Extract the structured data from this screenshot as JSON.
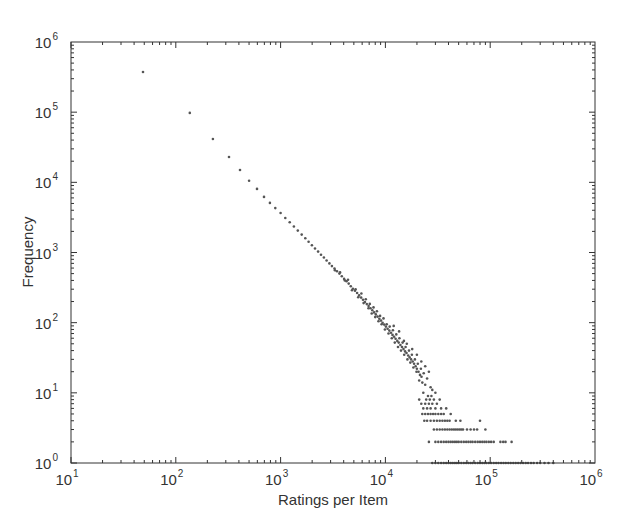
{
  "chart_data": {
    "type": "scatter",
    "title": "",
    "xlabel": "Ratings per Item",
    "ylabel": "Frequency",
    "xscale": "log",
    "yscale": "log",
    "xlim": [
      10,
      1000000
    ],
    "ylim": [
      1,
      1000000
    ],
    "grid": false,
    "legend": null,
    "x_ticks": [
      {
        "base": "10",
        "exp": "1",
        "value": 10
      },
      {
        "base": "10",
        "exp": "2",
        "value": 100
      },
      {
        "base": "10",
        "exp": "3",
        "value": 1000
      },
      {
        "base": "10",
        "exp": "4",
        "value": 10000
      },
      {
        "base": "10",
        "exp": "5",
        "value": 100000
      },
      {
        "base": "10",
        "exp": "6",
        "value": 1000000
      }
    ],
    "y_ticks": [
      {
        "base": "10",
        "exp": "0",
        "value": 1
      },
      {
        "base": "10",
        "exp": "1",
        "value": 10
      },
      {
        "base": "10",
        "exp": "2",
        "value": 100
      },
      {
        "base": "10",
        "exp": "3",
        "value": 1000
      },
      {
        "base": "10",
        "exp": "4",
        "value": 10000
      },
      {
        "base": "10",
        "exp": "5",
        "value": 100000
      },
      {
        "base": "10",
        "exp": "6",
        "value": 1000000
      }
    ],
    "marker_color": "#555555",
    "series": [
      {
        "name": "items",
        "trend": "power law, frequency ~ ratings^-1.5",
        "points": [
          [
            48.6,
            374000
          ],
          [
            136,
            97500
          ],
          [
            226,
            41500
          ],
          [
            322,
            23000
          ],
          [
            410,
            15000
          ],
          [
            500,
            10500
          ],
          [
            596,
            8050
          ],
          [
            695,
            6200
          ],
          [
            790,
            5100
          ],
          [
            890,
            4300
          ],
          [
            1000,
            3650
          ],
          [
            1110,
            3100
          ],
          [
            1220,
            2700
          ],
          [
            1340,
            2350
          ],
          [
            1460,
            2050
          ],
          [
            1590,
            1800
          ],
          [
            1720,
            1600
          ],
          [
            1850,
            1420
          ],
          [
            1990,
            1270
          ],
          [
            2130,
            1140
          ],
          [
            2280,
            1030
          ],
          [
            2430,
            930
          ],
          [
            2590,
            850
          ],
          [
            2750,
            770
          ],
          [
            2920,
            700
          ],
          [
            3090,
            640
          ],
          [
            3270,
            590
          ],
          [
            3450,
            540
          ],
          [
            3640,
            500
          ],
          [
            3840,
            460
          ],
          [
            4040,
            420
          ],
          [
            4250,
            390
          ],
          [
            4460,
            360
          ],
          [
            4680,
            330
          ],
          [
            4900,
            305
          ],
          [
            5130,
            285
          ],
          [
            5370,
            265
          ],
          [
            5610,
            245
          ],
          [
            5860,
            228
          ],
          [
            6110,
            212
          ],
          [
            6380,
            197
          ],
          [
            6650,
            184
          ],
          [
            6920,
            172
          ],
          [
            7210,
            160
          ],
          [
            7500,
            150
          ],
          [
            7800,
            140
          ],
          [
            8100,
            131
          ],
          [
            8420,
            122
          ],
          [
            8740,
            114
          ],
          [
            9070,
            107
          ],
          [
            9400,
            100
          ],
          [
            9750,
            94
          ],
          [
            10100,
            88
          ],
          [
            10500,
            82
          ],
          [
            10900,
            77
          ],
          [
            11300,
            72
          ],
          [
            11700,
            67
          ],
          [
            12100,
            63
          ],
          [
            12500,
            59
          ],
          [
            13000,
            55
          ],
          [
            13400,
            52
          ],
          [
            13900,
            48
          ],
          [
            14400,
            45
          ],
          [
            14900,
            42
          ],
          [
            15400,
            39
          ],
          [
            15900,
            37
          ],
          [
            16500,
            34
          ],
          [
            17000,
            32
          ],
          [
            17600,
            30
          ],
          [
            18200,
            28
          ],
          [
            18800,
            26
          ],
          [
            19400,
            24
          ],
          [
            20000,
            22
          ],
          [
            20700,
            20
          ],
          [
            21400,
            18
          ],
          [
            22100,
            17
          ],
          [
            3300,
            560
          ],
          [
            3700,
            520
          ],
          [
            4100,
            400
          ],
          [
            4400,
            410
          ],
          [
            4800,
            290
          ],
          [
            5200,
            300
          ],
          [
            5500,
            230
          ],
          [
            5900,
            260
          ],
          [
            6200,
            190
          ],
          [
            6500,
            215
          ],
          [
            6900,
            160
          ],
          [
            7100,
            185
          ],
          [
            7400,
            135
          ],
          [
            7700,
            165
          ],
          [
            8000,
            120
          ],
          [
            8300,
            145
          ],
          [
            8600,
            105
          ],
          [
            8900,
            125
          ],
          [
            9200,
            95
          ],
          [
            9600,
            115
          ],
          [
            9900,
            80
          ],
          [
            10300,
            95
          ],
          [
            10700,
            70
          ],
          [
            11000,
            88
          ],
          [
            11500,
            60
          ],
          [
            11800,
            78
          ],
          [
            12300,
            52
          ],
          [
            12700,
            68
          ],
          [
            13200,
            45
          ],
          [
            13600,
            60
          ],
          [
            14100,
            40
          ],
          [
            14600,
            52
          ],
          [
            15100,
            35
          ],
          [
            15600,
            45
          ],
          [
            16200,
            30
          ],
          [
            16800,
            40
          ],
          [
            17300,
            27
          ],
          [
            17900,
            35
          ],
          [
            18500,
            23
          ],
          [
            19100,
            30
          ],
          [
            19800,
            20
          ],
          [
            20400,
            26
          ],
          [
            21000,
            15
          ],
          [
            21800,
            22
          ],
          [
            22500,
            14
          ],
          [
            23200,
            19
          ],
          [
            24000,
            13
          ],
          [
            25000,
            16
          ],
          [
            12000,
            90
          ],
          [
            13500,
            75
          ],
          [
            15000,
            55
          ],
          [
            16000,
            50
          ],
          [
            18000,
            42
          ],
          [
            20000,
            35
          ],
          [
            22000,
            28
          ],
          [
            24000,
            24
          ],
          [
            26000,
            20
          ],
          [
            27000,
            12
          ],
          [
            28000,
            11
          ],
          [
            30000,
            10
          ],
          [
            23000,
            10
          ],
          [
            25500,
            9
          ],
          [
            27500,
            9
          ],
          [
            29000,
            8
          ],
          [
            21000,
            8
          ],
          [
            24500,
            8
          ],
          [
            26500,
            8
          ],
          [
            33000,
            8
          ],
          [
            22000,
            7
          ],
          [
            24000,
            7
          ],
          [
            26000,
            7
          ],
          [
            28000,
            7
          ],
          [
            31000,
            7
          ],
          [
            23000,
            6
          ],
          [
            25000,
            6
          ],
          [
            27000,
            6
          ],
          [
            30000,
            6
          ],
          [
            34000,
            6
          ],
          [
            38000,
            6
          ],
          [
            22500,
            5
          ],
          [
            24000,
            5
          ],
          [
            25500,
            5
          ],
          [
            27000,
            5
          ],
          [
            28500,
            5
          ],
          [
            30000,
            5
          ],
          [
            32000,
            5
          ],
          [
            34000,
            5
          ],
          [
            36000,
            5
          ],
          [
            42000,
            5
          ],
          [
            23500,
            4
          ],
          [
            25000,
            4
          ],
          [
            27000,
            4
          ],
          [
            29000,
            4
          ],
          [
            31000,
            4
          ],
          [
            33000,
            4
          ],
          [
            35000,
            4
          ],
          [
            37000,
            4
          ],
          [
            39000,
            4
          ],
          [
            41000,
            4
          ],
          [
            47000,
            4
          ],
          [
            52000,
            4
          ],
          [
            80000,
            4
          ],
          [
            29000,
            3
          ],
          [
            31000,
            3
          ],
          [
            33000,
            3
          ],
          [
            35000,
            3
          ],
          [
            37000,
            3
          ],
          [
            39000,
            3
          ],
          [
            41000,
            3
          ],
          [
            43000,
            3
          ],
          [
            45000,
            3
          ],
          [
            47000,
            3
          ],
          [
            49000,
            3
          ],
          [
            51000,
            3
          ],
          [
            53000,
            3
          ],
          [
            55000,
            3
          ],
          [
            60000,
            3
          ],
          [
            65000,
            3
          ],
          [
            70000,
            3
          ],
          [
            75000,
            3
          ],
          [
            90000,
            3
          ],
          [
            26000,
            2
          ],
          [
            30000,
            2
          ],
          [
            32000,
            2
          ],
          [
            34000,
            2
          ],
          [
            36000,
            2
          ],
          [
            38000,
            2
          ],
          [
            40000,
            2
          ],
          [
            42000,
            2
          ],
          [
            44000,
            2
          ],
          [
            46000,
            2
          ],
          [
            48000,
            2
          ],
          [
            50000,
            2
          ],
          [
            53000,
            2
          ],
          [
            56000,
            2
          ],
          [
            59000,
            2
          ],
          [
            62000,
            2
          ],
          [
            65000,
            2
          ],
          [
            68000,
            2
          ],
          [
            72000,
            2
          ],
          [
            76000,
            2
          ],
          [
            80000,
            2
          ],
          [
            84000,
            2
          ],
          [
            88000,
            2
          ],
          [
            92000,
            2
          ],
          [
            97000,
            2
          ],
          [
            102000,
            2
          ],
          [
            108000,
            2
          ],
          [
            125000,
            2
          ],
          [
            133000,
            2
          ],
          [
            140000,
            2
          ],
          [
            160000,
            2
          ],
          [
            28000,
            1
          ],
          [
            30000,
            1
          ],
          [
            32000,
            1
          ],
          [
            34000,
            1
          ],
          [
            36000,
            1
          ],
          [
            38000,
            1
          ],
          [
            40000,
            1
          ],
          [
            42000,
            1
          ],
          [
            44000,
            1
          ],
          [
            46000,
            1
          ],
          [
            48000,
            1
          ],
          [
            50000,
            1
          ],
          [
            53000,
            1
          ],
          [
            56000,
            1
          ],
          [
            59000,
            1
          ],
          [
            62000,
            1
          ],
          [
            65000,
            1
          ],
          [
            68000,
            1
          ],
          [
            72000,
            1
          ],
          [
            76000,
            1
          ],
          [
            80000,
            1
          ],
          [
            84000,
            1
          ],
          [
            88000,
            1
          ],
          [
            92000,
            1
          ],
          [
            97000,
            1
          ],
          [
            102000,
            1
          ],
          [
            108000,
            1
          ],
          [
            114000,
            1
          ],
          [
            120000,
            1
          ],
          [
            127000,
            1
          ],
          [
            134000,
            1
          ],
          [
            141000,
            1
          ],
          [
            149000,
            1
          ],
          [
            157000,
            1
          ],
          [
            166000,
            1
          ],
          [
            175000,
            1
          ],
          [
            185000,
            1
          ],
          [
            195000,
            1
          ],
          [
            206000,
            1
          ],
          [
            218000,
            1
          ],
          [
            230000,
            1
          ],
          [
            245000,
            1
          ],
          [
            260000,
            1
          ],
          [
            280000,
            1
          ],
          [
            300000,
            1
          ],
          [
            330000,
            1
          ],
          [
            360000,
            1
          ],
          [
            400000,
            1
          ]
        ]
      }
    ]
  }
}
